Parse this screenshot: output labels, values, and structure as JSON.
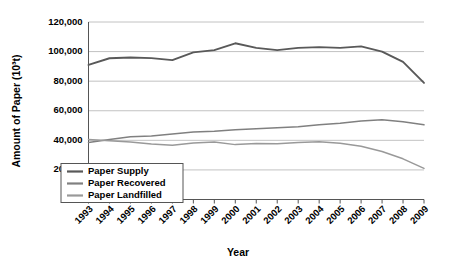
{
  "chart_data": {
    "type": "line",
    "title": "",
    "xlabel": "Year",
    "ylabel": "Amount of Paper (10³t)",
    "categories": [
      "1993",
      "1994",
      "1995",
      "1996",
      "1997",
      "1998",
      "1999",
      "2000",
      "2001",
      "2002",
      "2003",
      "2004",
      "2005",
      "2006",
      "2007",
      "2008",
      "2009"
    ],
    "x": [
      1993,
      1994,
      1995,
      1996,
      1997,
      1998,
      1999,
      2000,
      2001,
      2002,
      2003,
      2004,
      2005,
      2006,
      2007,
      2008,
      2009
    ],
    "ylim": [
      0,
      120000
    ],
    "ytick_labels": [
      "0",
      "20,000",
      "40,000",
      "60,000",
      "80,000",
      "100,000",
      "120,000"
    ],
    "ytick_values": [
      0,
      20000,
      40000,
      60000,
      80000,
      100000,
      120000
    ],
    "grid": true,
    "legend_position": "bottom-left",
    "series": [
      {
        "name": "Paper Supply",
        "color": "#595959",
        "values": [
          91000,
          95500,
          96000,
          95600,
          94200,
          99500,
          101000,
          105600,
          102500,
          101000,
          102500,
          103000,
          102500,
          103500,
          100000,
          93000,
          78800
        ]
      },
      {
        "name": "Paper Recovered",
        "color": "#808080",
        "values": [
          38500,
          40500,
          42500,
          43000,
          44300,
          45600,
          46200,
          47200,
          47800,
          48500,
          49200,
          50500,
          51500,
          53000,
          54000,
          52500,
          50500
        ]
      },
      {
        "name": "Paper Landfilled",
        "color": "#999999",
        "values": [
          40500,
          39700,
          38800,
          37500,
          36700,
          38200,
          38800,
          37100,
          37800,
          37700,
          38500,
          39000,
          38000,
          36000,
          32500,
          27500,
          21000
        ]
      }
    ]
  },
  "legend": {
    "items": [
      {
        "label": "Paper Supply"
      },
      {
        "label": "Paper Recovered"
      },
      {
        "label": "Paper Landfilled"
      }
    ]
  },
  "axes": {
    "y_title": "Amount of Paper (10³t)",
    "x_title": "Year"
  }
}
